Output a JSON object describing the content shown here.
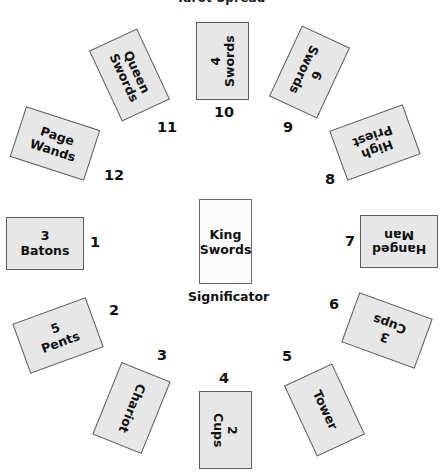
{
  "diagram": {
    "title": "Tarot Spread",
    "significator_label": "Significator",
    "colors": {
      "card_fill": "#e7e7e7",
      "card_border": "#5d5d5d",
      "center_card_fill": "#fbfbfb",
      "text": "#111111",
      "background": "#ffffff"
    },
    "center_card": {
      "name": "center-card",
      "line1": "King",
      "line2": "Swords",
      "text": "King\nSwords"
    },
    "cards": [
      {
        "position": 1,
        "number": "1",
        "line1": "3",
        "line2": "Batons",
        "text": "3\nBatons",
        "orientation": "upright"
      },
      {
        "position": 2,
        "number": "2",
        "line1": "5",
        "line2": "Pents",
        "text": "5\nPents",
        "orientation": "upright"
      },
      {
        "position": 3,
        "number": "3",
        "line1": "Chariot",
        "line2": "",
        "text": "Chariot",
        "orientation": "upright"
      },
      {
        "position": 4,
        "number": "4",
        "line1": "2",
        "line2": "Cups",
        "text": "2\nCups",
        "orientation": "upright"
      },
      {
        "position": 5,
        "number": "5",
        "line1": "Tower",
        "line2": "",
        "text": "Tower",
        "orientation": "upright"
      },
      {
        "position": 6,
        "number": "6",
        "line1": "3",
        "line2": "Cups",
        "text": "3\nCups",
        "orientation": "reversed"
      },
      {
        "position": 7,
        "number": "7",
        "line1": "Hanged",
        "line2": "Man",
        "text": "Hanged\nMan",
        "orientation": "reversed"
      },
      {
        "position": 8,
        "number": "8",
        "line1": "High",
        "line2": "Priest",
        "text": "High\nPriest",
        "orientation": "reversed"
      },
      {
        "position": 9,
        "number": "9",
        "line1": "6",
        "line2": "Swords",
        "text": "6\nSwords",
        "orientation": "reversed"
      },
      {
        "position": 10,
        "number": "10",
        "line1": "4",
        "line2": "Swords",
        "text": "4\nSwords",
        "orientation": "upright"
      },
      {
        "position": 11,
        "number": "11",
        "line1": "Queen",
        "line2": "Swords",
        "text": "Queen\nSwords",
        "orientation": "upright"
      },
      {
        "position": 12,
        "number": "12",
        "line1": "Page",
        "line2": "Wands",
        "text": "Page\nWands",
        "orientation": "upright"
      }
    ]
  }
}
